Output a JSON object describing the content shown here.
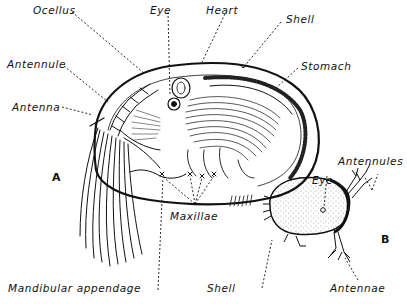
{
  "figure": {
    "panels": [
      {
        "id": "A",
        "label": "A",
        "subject": "adult ostracod, internal anatomy (shell valve removed)"
      },
      {
        "id": "B",
        "label": "B",
        "subject": "ostracod nauplius / larva, external view"
      }
    ],
    "labels_a": {
      "ocellus": "Ocellus",
      "eye": "Eye",
      "heart": "Heart",
      "shell": "Shell",
      "stomach": "Stomach",
      "antennule": "Antennule",
      "antenna": "Antenna",
      "maxillae": "Maxillae",
      "mandibular_appendage": "Mandibular appendage"
    },
    "labels_b": {
      "antennules": "Antennules",
      "eye": "Eye",
      "shell": "Shell",
      "antennae": "Antennae"
    },
    "colors": {
      "ink": "#111111",
      "background": "#ffffff",
      "stipple": "#444444"
    }
  }
}
